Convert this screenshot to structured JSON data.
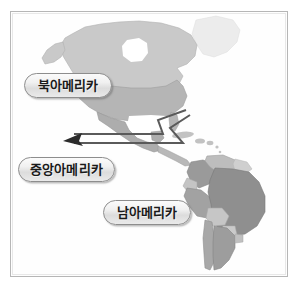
{
  "figure": {
    "background_color": "#ffffff",
    "frame_color": "#b6b6b6"
  },
  "map": {
    "name": "americas-map",
    "style": "grayscale political map",
    "ocean_color": "#ffffff",
    "regions": [
      {
        "name": "greenland",
        "label": "Greenland",
        "fill": "#ececec"
      },
      {
        "name": "canada",
        "label": "Canada",
        "fill": "#c9c9c9"
      },
      {
        "name": "united-states",
        "label": "United States",
        "fill": "#b5b5b5"
      },
      {
        "name": "mexico",
        "label": "Mexico",
        "fill": "#adadad"
      },
      {
        "name": "central-america",
        "label": "Central America",
        "fill": "#b8b8b8"
      },
      {
        "name": "caribbean",
        "label": "Caribbean",
        "fill": "#c2c2c2"
      },
      {
        "name": "colombia",
        "label": "Colombia",
        "fill": "#9a9a9a"
      },
      {
        "name": "venezuela",
        "label": "Venezuela",
        "fill": "#bdbdbd"
      },
      {
        "name": "guianas",
        "label": "Guianas",
        "fill": "#cfcfcf"
      },
      {
        "name": "ecuador",
        "label": "Ecuador",
        "fill": "#c4c4c4"
      },
      {
        "name": "peru",
        "label": "Peru",
        "fill": "#a2a2a2"
      },
      {
        "name": "brazil",
        "label": "Brazil",
        "fill": "#8f8f8f"
      },
      {
        "name": "bolivia",
        "label": "Bolivia",
        "fill": "#c6c6c6"
      },
      {
        "name": "paraguay",
        "label": "Paraguay",
        "fill": "#cacaca"
      },
      {
        "name": "chile",
        "label": "Chile",
        "fill": "#a8a8a8"
      },
      {
        "name": "argentina",
        "label": "Argentina",
        "fill": "#9d9d9d"
      },
      {
        "name": "uruguay",
        "label": "Uruguay",
        "fill": "#c0c0c0"
      }
    ]
  },
  "labels": {
    "north_america": "북아메리카",
    "central_america": "중앙아메리카",
    "south_america": "남아메리카"
  },
  "callout": {
    "name": "central-america-leader",
    "line_color": "#5a5a5a",
    "arrow_color": "#2b2b2b",
    "description": "zigzag leader line from the Central America label to the isthmus"
  }
}
